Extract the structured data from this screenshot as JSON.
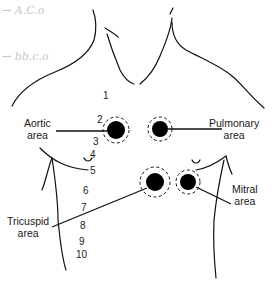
{
  "figure": {
    "type": "anatomical diagram"
  },
  "handwriting": {
    "line1": "→ A.C.o",
    "line2": "→ bb.c.o"
  },
  "labels": {
    "aortic": [
      "Aortic",
      "area"
    ],
    "pulmonary": [
      "Pulmonary",
      "area"
    ],
    "tricuspid": [
      "Tricuspid",
      "area"
    ],
    "mitral": [
      "Mitral",
      "area"
    ]
  },
  "intercostal_numbers": [
    "1",
    "2",
    "3",
    "4",
    "5",
    "6",
    "7",
    "8",
    "9",
    "10"
  ],
  "colors": {
    "ink": "#111111",
    "background": "#ffffff",
    "faint_handwriting": "#c8c8c8"
  }
}
